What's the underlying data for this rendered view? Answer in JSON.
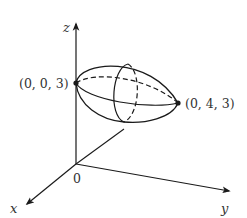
{
  "figure": {
    "type": "3d-ellipsoid-diagram",
    "axes": {
      "x_label": "x",
      "y_label": "y",
      "z_label": "z",
      "origin_label": "0"
    },
    "points": [
      {
        "label": "(0, 0, 3)",
        "role": "left-vertex"
      },
      {
        "label": "(0, 4, 3)",
        "role": "right-vertex"
      }
    ],
    "colors": {
      "stroke": "#1a1a1a",
      "text": "#333333",
      "background": "#ffffff"
    }
  }
}
